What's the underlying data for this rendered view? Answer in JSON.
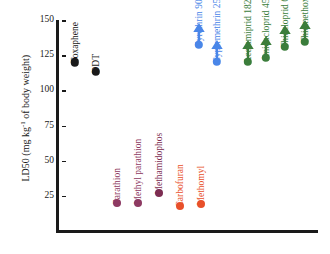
{
  "chart_data": {
    "type": "scatter",
    "title": "",
    "xlabel": "",
    "ylabel": "LD50 (mg kg-1 of body weight)",
    "ylabel_main": "LD50 (mg kg",
    "ylabel_sup": "-1",
    "ylabel_tail": " of body weight)",
    "ylim": [
      0,
      150
    ],
    "yticks": [
      150,
      125,
      100,
      75,
      50,
      25
    ],
    "grid": false,
    "legend": false,
    "categories": [
      "Toxaphene",
      "DDT",
      "Parathion",
      "Methyl parathion",
      "Methamidophos",
      "Carbofuran",
      "Methomyl",
      "Pyrethrin 900",
      "Cypermethrin 250",
      "Acetamiprid 182",
      "Imidacloprid 450",
      "Thiacloprid 640",
      "Thiamethoxam 1563"
    ],
    "values": [
      120,
      113,
      20,
      20,
      27,
      18,
      19,
      150,
      150,
      150,
      150,
      150,
      150
    ],
    "points": [
      {
        "label": "Toxaphene",
        "value": 120,
        "color": "#1a1a1a",
        "group": "organochlorine",
        "arrow": false,
        "value_text": ""
      },
      {
        "label": "DDT",
        "value": 113,
        "color": "#1a1a1a",
        "group": "organochlorine",
        "arrow": false,
        "value_text": ""
      },
      {
        "label": "Parathion",
        "value": 20,
        "color": "#8e3a62",
        "group": "organophosphate",
        "arrow": false,
        "value_text": ""
      },
      {
        "label": "Methyl parathion",
        "value": 20,
        "color": "#8e3a62",
        "group": "organophosphate",
        "arrow": false,
        "value_text": ""
      },
      {
        "label": "Methamidophos",
        "value": 27,
        "color": "#7d2d52",
        "group": "organophosphate",
        "arrow": false,
        "value_text": ""
      },
      {
        "label": "Carbofuran",
        "value": 18,
        "color": "#e8502a",
        "group": "carbamate",
        "arrow": false,
        "value_text": ""
      },
      {
        "label": "Methomyl",
        "value": 19,
        "color": "#e8502a",
        "group": "carbamate",
        "arrow": false,
        "value_text": ""
      },
      {
        "label": "Pyrethrin 900",
        "value": 900,
        "color": "#4a86e8",
        "group": "pyrethroid",
        "arrow": true,
        "value_text": "900"
      },
      {
        "label": "Cypermethrin 250",
        "value": 250,
        "color": "#4a86e8",
        "group": "pyrethroid",
        "arrow": true,
        "value_text": "250"
      },
      {
        "label": "Acetamiprid 182",
        "value": 182,
        "color": "#3b7d3b",
        "group": "neonicotinoid",
        "arrow": true,
        "value_text": "182"
      },
      {
        "label": "Imidacloprid 450",
        "value": 450,
        "color": "#3b7d3b",
        "group": "neonicotinoid",
        "arrow": true,
        "value_text": "450"
      },
      {
        "label": "Thiacloprid 640",
        "value": 640,
        "color": "#3b7d3b",
        "group": "neonicotinoid",
        "arrow": true,
        "value_text": "640"
      },
      {
        "label": "Thiamethoxam 1563",
        "value": 1563,
        "color": "#3b7d3b",
        "group": "neonicotinoid",
        "arrow": true,
        "value_text": "1563"
      }
    ],
    "colors": {
      "organochlorine": "#1a1a1a",
      "organophosphate": "#8e3a62",
      "carbamate": "#e8502a",
      "pyrethroid": "#4a86e8",
      "neonicotinoid": "#3b7d3b",
      "axis": "#1a1a1a",
      "background": "#ffffff"
    }
  }
}
